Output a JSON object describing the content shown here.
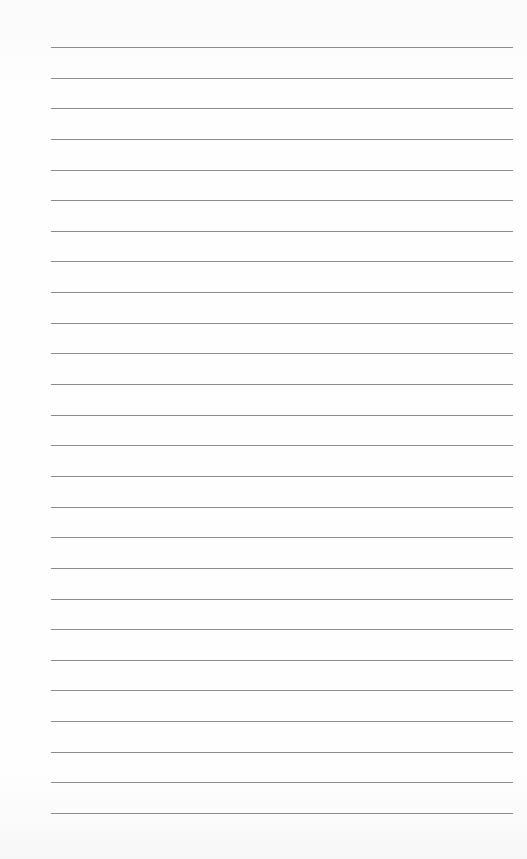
{
  "document": {
    "type": "lined-paper",
    "line_count": 26,
    "first_line_y": 47,
    "line_spacing": 30.64,
    "line_left": 51,
    "line_width": 462,
    "line_color": "#8c8c8c",
    "lines": [
      "",
      "",
      "",
      "",
      "",
      "",
      "",
      "",
      "",
      "",
      "",
      "",
      "",
      "",
      "",
      "",
      "",
      "",
      "",
      "",
      "",
      "",
      "",
      "",
      "",
      ""
    ]
  }
}
